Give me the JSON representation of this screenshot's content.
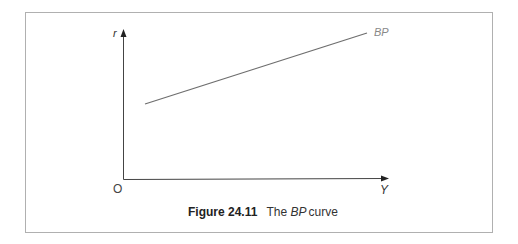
{
  "figure": {
    "number_label": "Figure 24.11",
    "caption_prefix": "The",
    "caption_italic": "BP",
    "caption_suffix": "curve"
  },
  "diagram": {
    "y_axis_label": "r",
    "x_axis_label": "Y",
    "origin_label": "O",
    "curve_label": "BP",
    "curve": {
      "from": [
        0.08,
        0.5
      ],
      "to": [
        0.92,
        0.98
      ]
    },
    "colors": {
      "axis": "#444444",
      "curve": "#6e6e6e",
      "frame": "#b0b0b0",
      "label": "#777777"
    }
  }
}
